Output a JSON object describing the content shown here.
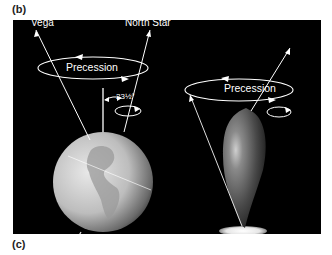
{
  "figure": {
    "panel_labels": {
      "top": "(b)",
      "bottom": "(c)"
    },
    "background_color": "#000000",
    "line_color": "#ffffff",
    "left_diagram": {
      "subject": "Earth",
      "star_labels": {
        "left": "Vega",
        "right": "North Star"
      },
      "motion_label": "Precession",
      "tilt_angle": "23½°"
    },
    "right_diagram": {
      "subject": "spinning-top",
      "motion_label": "Precession"
    }
  }
}
